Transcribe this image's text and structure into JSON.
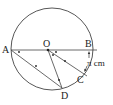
{
  "diagram": {
    "points": {
      "A": "A",
      "B": "B",
      "O": "O",
      "C": "C",
      "D": "D"
    },
    "arc_label": "π cm",
    "colors": {
      "stroke": "#444444",
      "text": "#222222"
    }
  }
}
